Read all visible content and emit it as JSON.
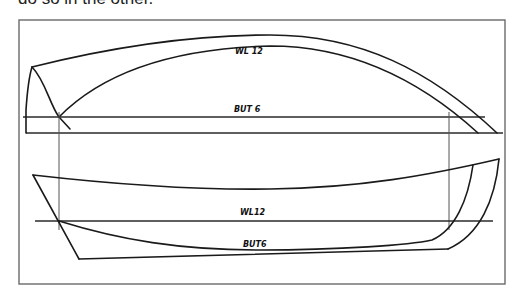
{
  "caption": {
    "text": "do so in the other."
  },
  "diagram": {
    "type": "boat-lines-drawing",
    "frame": {
      "stroke": "#6a6a6a"
    },
    "ink_color": "#1a1a1a",
    "top_view": {
      "name": "profile",
      "labels": {
        "waterline": "WL 12",
        "buttock": "BUT 6"
      }
    },
    "bottom_view": {
      "name": "half-breadth",
      "labels": {
        "waterline": "WL12",
        "buttock": "BUT6"
      }
    }
  }
}
